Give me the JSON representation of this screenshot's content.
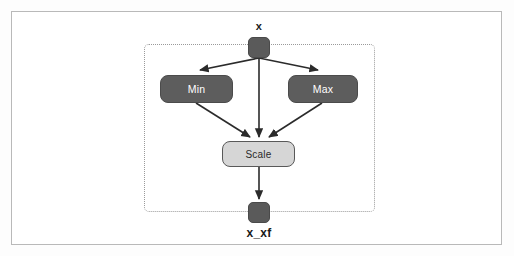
{
  "diagram": {
    "title": "x",
    "type": "block-diagram",
    "input_port": {
      "name": "input-port-x",
      "label": "x"
    },
    "output_port": {
      "name": "output-port-x-xf",
      "label": "x_xf"
    },
    "blocks": [
      {
        "id": "min",
        "label": "Min",
        "style": "dark"
      },
      {
        "id": "max",
        "label": "Max",
        "style": "dark"
      },
      {
        "id": "scale",
        "label": "Scale",
        "style": "light"
      }
    ],
    "connections": [
      {
        "from": "x",
        "to": "min"
      },
      {
        "from": "x",
        "to": "max"
      },
      {
        "from": "x",
        "to": "scale"
      },
      {
        "from": "min",
        "to": "scale"
      },
      {
        "from": "max",
        "to": "scale"
      },
      {
        "from": "scale",
        "to": "x_xf"
      }
    ],
    "colors": {
      "block_dark_fill": "#5d5d5d",
      "block_dark_text": "#ffffff",
      "block_light_fill": "#d6d6d6",
      "block_light_text": "#2a2a2a",
      "port_fill": "#5a5a5a",
      "edge": "#2b2b2b",
      "container_border": "#9a9a9a",
      "frame_border": "#b9b9b9",
      "background": "#ffffff"
    }
  }
}
